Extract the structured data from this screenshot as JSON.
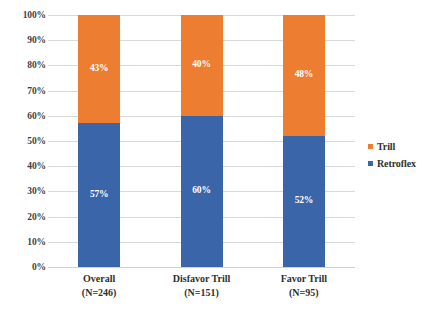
{
  "chart_data": {
    "type": "bar",
    "subtype": "stacked-100-percent",
    "title": "",
    "xlabel": "",
    "ylabel": "",
    "ylim": [
      0,
      100
    ],
    "ytick_labels": [
      "100%",
      "90%",
      "80%",
      "70%",
      "60%",
      "50%",
      "40%",
      "30%",
      "20%",
      "10%",
      "0%"
    ],
    "ytick_values": [
      100,
      90,
      80,
      70,
      60,
      50,
      40,
      30,
      20,
      10,
      0
    ],
    "grid": true,
    "legend_position": "right",
    "categories": [
      "Overall",
      "Disfavor Trill",
      "Favor Trill"
    ],
    "category_sublabels": [
      "(N=246)",
      "(N=151)",
      "(N=95)"
    ],
    "series": [
      {
        "name": "Retroflex",
        "color": "#3a65a8",
        "values": [
          57,
          60,
          52
        ],
        "labels": [
          "57%",
          "60%",
          "52%"
        ]
      },
      {
        "name": "Trill",
        "color": "#ed7d31",
        "values": [
          43,
          40,
          48
        ],
        "labels": [
          "43%",
          "40%",
          "48%"
        ]
      }
    ],
    "legend_entries": [
      {
        "label": "Trill",
        "color": "#ed7d31"
      },
      {
        "label": "Retroflex",
        "color": "#3a65a8"
      }
    ]
  }
}
